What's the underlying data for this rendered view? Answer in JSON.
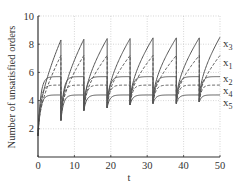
{
  "chart_data": {
    "type": "line",
    "title": "",
    "xlabel": "t",
    "ylabel": "Number of unsatisfied orders",
    "xlim": [
      0,
      50
    ],
    "ylim": [
      0,
      10
    ],
    "xticks": [
      0,
      10,
      20,
      30,
      40,
      50
    ],
    "yticks": [
      2,
      4,
      6,
      8,
      10
    ],
    "ytick_labels": [
      "2",
      "4",
      "6",
      "8",
      "10"
    ],
    "xtick_labels": [
      "0",
      "10",
      "20",
      "30",
      "40",
      "50"
    ],
    "grid": true,
    "legend_position": "right-inline-labels",
    "period": 6.3,
    "reset_times": [
      6.3,
      12.6,
      19.0,
      25.3,
      31.6,
      38.0,
      44.3
    ],
    "reset_min_values": [
      2.6,
      3.3,
      3.5,
      3.7,
      3.8,
      3.8,
      3.9
    ],
    "initial_value": 1.5,
    "series": [
      {
        "name": "x3",
        "label_main": "x",
        "label_sub": "3",
        "style": "solid",
        "peak_values": [
          8.3,
          8.35,
          8.4,
          8.4,
          8.45,
          8.45,
          8.45,
          8.5
        ],
        "shape": "concave-rise"
      },
      {
        "name": "x1",
        "label_main": "x",
        "label_sub": "1",
        "style": "dashed",
        "peak_values": [
          7.2,
          7.2,
          7.2,
          7.2,
          7.2,
          7.2,
          7.2,
          7.2
        ],
        "shape": "concave-rise"
      },
      {
        "name": "x2",
        "label_main": "x",
        "label_sub": "2",
        "style": "solid",
        "peak_values": [
          5.7,
          5.7,
          5.7,
          5.7,
          5.7,
          5.7,
          5.7,
          5.7
        ],
        "shape": "saturating"
      },
      {
        "name": "x4",
        "label_main": "x",
        "label_sub": "4",
        "style": "dashed",
        "peak_values": [
          5.1,
          5.1,
          5.1,
          5.1,
          5.1,
          5.1,
          5.1,
          5.1
        ],
        "shape": "saturating"
      },
      {
        "name": "x5",
        "label_main": "x",
        "label_sub": "5",
        "style": "solid",
        "peak_values": [
          4.4,
          4.4,
          4.4,
          4.4,
          4.4,
          4.4,
          4.4,
          4.4
        ],
        "shape": "saturating"
      }
    ]
  },
  "colors": {
    "line": "#555555",
    "axis": "#333333",
    "grid": "#bbbbbb"
  }
}
